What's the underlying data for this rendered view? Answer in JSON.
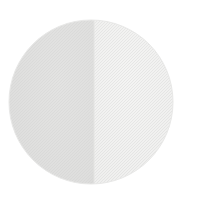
{
  "canvas": {
    "width": 201,
    "height": 198,
    "background_color": "#ffffff",
    "title": "Two-tone circular swatch"
  },
  "shape": {
    "name": "split-circle",
    "type": "circle",
    "center_x": 91,
    "center_y": 102,
    "radius": 82,
    "outline_color": "#e8e8e7",
    "description": "Circle divided vertically into a darker left half and a lighter right half"
  },
  "halves": [
    {
      "id": "left",
      "label": "Left half",
      "fill_color": "#dededd",
      "edge_shadow_color": "#d4d4d3",
      "side": "left"
    },
    {
      "id": "right",
      "label": "Right half",
      "fill_color": "#efefee",
      "edge_shadow_color": "#e7e7e6",
      "side": "right"
    }
  ],
  "divider": {
    "name": "vertical-split-line",
    "x": 94,
    "color": "#e3e3e2",
    "width": 1
  },
  "texture": {
    "name": "halftone-dither",
    "opacity": 0.35,
    "cell_size": 3,
    "dot_color": "#cfcfce"
  }
}
